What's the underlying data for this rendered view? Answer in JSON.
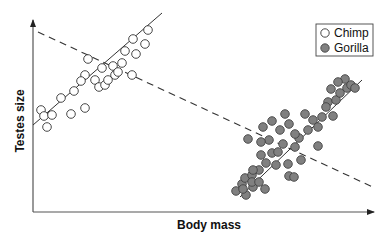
{
  "chart_data": {
    "type": "scatter",
    "title": "",
    "xlabel": "Body mass",
    "ylabel": "Testes size",
    "xlim": [
      0,
      340
    ],
    "ylim": [
      0,
      192
    ],
    "grid": false,
    "ticks": "none",
    "legend": {
      "position": "top-right",
      "entries": [
        "Chimp",
        "Gorilla"
      ]
    },
    "series": [
      {
        "name": "Chimp",
        "marker": "open-circle",
        "color": "#ffffff",
        "stroke": "#333333",
        "points": [
          [
            8,
            102
          ],
          [
            11,
            96
          ],
          [
            19,
            97
          ],
          [
            14,
            85
          ],
          [
            28,
            114
          ],
          [
            38,
            98
          ],
          [
            52,
            104
          ],
          [
            41,
            121
          ],
          [
            52,
            137
          ],
          [
            55,
            153
          ],
          [
            48,
            131
          ],
          [
            62,
            132
          ],
          [
            66,
            125
          ],
          [
            69,
            144
          ],
          [
            72,
            127
          ],
          [
            80,
            146
          ],
          [
            75,
            132
          ],
          [
            89,
            149
          ],
          [
            82,
            137
          ],
          [
            99,
            137
          ],
          [
            92,
            161
          ],
          [
            103,
            158
          ],
          [
            85,
            140
          ],
          [
            112,
            168
          ],
          [
            115,
            182
          ],
          [
            100,
            173
          ]
        ]
      },
      {
        "name": "Gorilla",
        "marker": "filled-circle",
        "color": "#808080",
        "stroke": "#444444",
        "points": [
          [
            203,
            21
          ],
          [
            209,
            28
          ],
          [
            213,
            17
          ],
          [
            220,
            25
          ],
          [
            212,
            34
          ],
          [
            219,
            37
          ],
          [
            226,
            42
          ],
          [
            233,
            49
          ],
          [
            228,
            57
          ],
          [
            239,
            59
          ],
          [
            236,
            72
          ],
          [
            245,
            60
          ],
          [
            255,
            48
          ],
          [
            250,
            68
          ],
          [
            256,
            36
          ],
          [
            243,
            47
          ],
          [
            228,
            70
          ],
          [
            220,
            42
          ],
          [
            262,
            65
          ],
          [
            268,
            52
          ],
          [
            261,
            35
          ],
          [
            232,
            23
          ],
          [
            219,
            30
          ],
          [
            210,
            23
          ],
          [
            226,
            30
          ],
          [
            247,
            82
          ],
          [
            256,
            88
          ],
          [
            266,
            74
          ],
          [
            275,
            82
          ],
          [
            280,
            92
          ],
          [
            285,
            85
          ],
          [
            289,
            95
          ],
          [
            295,
            110
          ],
          [
            303,
            112
          ],
          [
            307,
            119
          ],
          [
            298,
            123
          ],
          [
            314,
            124
          ],
          [
            312,
            133
          ],
          [
            318,
            127
          ],
          [
            305,
            130
          ],
          [
            300,
            96
          ],
          [
            285,
            66
          ],
          [
            272,
            98
          ],
          [
            252,
            98
          ],
          [
            239,
            91
          ],
          [
            230,
            85
          ],
          [
            215,
            73
          ],
          [
            262,
            78
          ],
          [
            322,
            124
          ],
          [
            293,
            105
          ]
        ]
      }
    ],
    "fit_lines": [
      {
        "series": "Chimp",
        "style": "solid",
        "from": [
          0,
          87
        ],
        "to": [
          129,
          199
        ]
      },
      {
        "series": "Gorilla",
        "style": "solid",
        "from": [
          207,
          15
        ],
        "to": [
          329,
          132
        ]
      },
      {
        "series": "All",
        "style": "dashed",
        "from": [
          5,
          180
        ],
        "to": [
          342,
          24
        ]
      }
    ]
  },
  "legend": {
    "items": [
      {
        "label": "Chimp",
        "marker": "open-circle"
      },
      {
        "label": "Gorilla",
        "marker": "filled-circle"
      }
    ]
  },
  "axes": {
    "x_label": "Body mass",
    "y_label": "Testes size"
  }
}
